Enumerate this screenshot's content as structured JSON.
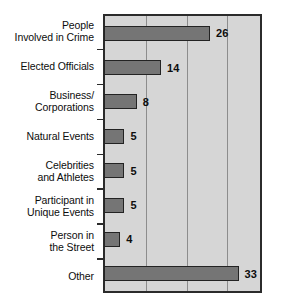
{
  "chart_data": {
    "type": "bar",
    "orientation": "horizontal",
    "title": "",
    "subtitle": "",
    "xlabel": "",
    "ylabel": "",
    "categories": [
      "People Involved in Crime",
      "Elected Officials",
      "Business/ Corporations",
      "Natural Events",
      "Celebrities and Athletes",
      "Participant in Unique Events",
      "Person in the Street",
      "Other"
    ],
    "category_lines": [
      [
        "People",
        "Involved in Crime"
      ],
      [
        "Elected Officials"
      ],
      [
        "Business/",
        "Corporations"
      ],
      [
        "Natural Events"
      ],
      [
        "Celebrities",
        "and Athletes"
      ],
      [
        "Participant in",
        "Unique Events"
      ],
      [
        "Person in",
        "the Street"
      ],
      [
        "Other"
      ]
    ],
    "values": [
      26,
      14,
      8,
      5,
      5,
      5,
      4,
      33
    ],
    "value_labels": [
      "26",
      "14",
      "8",
      "5",
      "5",
      "5",
      "4",
      "33"
    ],
    "xlim": [
      0,
      38
    ],
    "gridlines": [
      10,
      20,
      30
    ],
    "grid": true,
    "legend": "none",
    "colors": {
      "bar_fill": "#757575",
      "bar_edge": "#232323",
      "plot_background": "#d6d6d6",
      "plot_border": "#2b2b2b",
      "gridline": "#8d8d8d",
      "page_background": "#ffffff",
      "text": "#0d0d0d"
    }
  }
}
